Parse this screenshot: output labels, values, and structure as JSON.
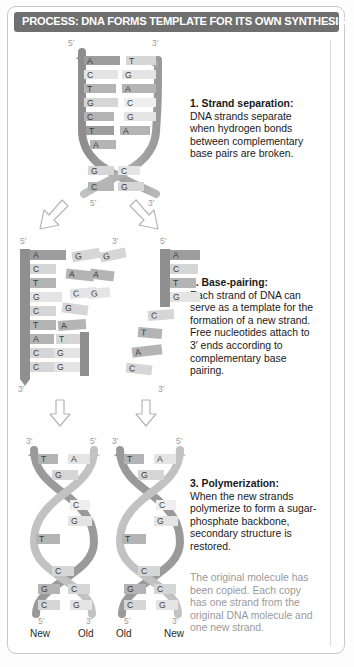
{
  "title": "PROCESS: DNA FORMS TEMPLATE FOR ITS OWN SYNTHESIS",
  "steps": [
    {
      "id": "step1",
      "heading": "1. Strand separation:",
      "body": "DNA strands separate when hydrogen bonds between complementary base pairs are broken."
    },
    {
      "id": "step2",
      "heading": "2. Base-pairing:",
      "body": "Each strand of DNA can serve as a template for the formation of a new strand. Free nucleotides attach to 3′ ends according to complementary base pairing."
    },
    {
      "id": "step3",
      "heading": "3. Polymerization:",
      "body": "When the new strands polymerize to form a sugar-phosphate backbone, secondary structure is restored."
    }
  ],
  "note": "The original molecule has been copied. Each copy has one strand from the original DNA molecule and one new strand.",
  "end_labels": {
    "five_prime": "5′",
    "three_prime": "3′"
  },
  "stage1": {
    "left_label": "5′",
    "right_label": "3′",
    "bottom_left_label": "5′",
    "bottom_right_label": "3′",
    "left_strand": [
      "A",
      "C",
      "T",
      "G",
      "C",
      "T",
      "A"
    ],
    "right_strand": [
      "T",
      "G",
      "A",
      "C",
      "G",
      "A"
    ],
    "crossover_pairs": [
      [
        "G",
        "C"
      ],
      [
        "C",
        "G"
      ]
    ]
  },
  "stage2": {
    "left_ladder": {
      "top_label": "5′",
      "bottom_label": "3′",
      "template": [
        "A",
        "C",
        "T",
        "G",
        "C",
        "T",
        "A",
        "C",
        "C"
      ],
      "paired": [
        "T",
        "G",
        "G"
      ],
      "free_nucleotides": [
        "G",
        "A",
        "C",
        "G",
        "A"
      ]
    },
    "right_ladder": {
      "top_label": "5′",
      "bottom_label": "3′",
      "template": [
        "A",
        "C",
        "T",
        "G"
      ],
      "free_nucleotides": [
        "C",
        "T",
        "A",
        "C"
      ],
      "left_stub_label": "3′",
      "stub_bases": [
        "G",
        "A",
        "G"
      ]
    }
  },
  "stage3": {
    "helices": [
      {
        "left_label": "3′",
        "right_label": "5′",
        "bottom_left_label": "5′",
        "bottom_right_label": "3′",
        "left_bases": [
          "T",
          "G",
          "T",
          "C",
          "G",
          "C"
        ],
        "right_bases": [
          "A",
          "C",
          "G",
          "C",
          "G"
        ],
        "foot_left": "New",
        "foot_right": "Old"
      },
      {
        "left_label": "3′",
        "right_label": "5′",
        "bottom_left_label": "5′",
        "bottom_right_label": "3′",
        "left_bases": [
          "T",
          "G",
          "T",
          "C",
          "G",
          "C"
        ],
        "right_bases": [
          "A",
          "C",
          "G",
          "C",
          "G"
        ],
        "foot_left": "Old",
        "foot_right": "New"
      }
    ]
  },
  "colors": {
    "title_bar": "#6f6f6f",
    "backbone_dark": "#8f8f8f",
    "backbone_light": "#b9b9b9",
    "base_dark": "#9d9d9d",
    "base_light": "#d6d6d6",
    "note_text": "#9a9a9a"
  }
}
